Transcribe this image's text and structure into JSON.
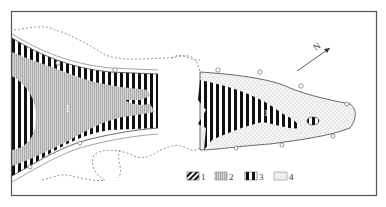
{
  "figure": {
    "north_label": "N",
    "zone_labels": {
      "left": "I",
      "right": "II"
    },
    "legend": [
      {
        "id": "1",
        "label": "1",
        "pattern": "diagonal-hatch"
      },
      {
        "id": "2",
        "label": "2",
        "pattern": "fine-vertical-gray"
      },
      {
        "id": "3",
        "label": "3",
        "pattern": "bold-vertical-stripes"
      },
      {
        "id": "4",
        "label": "4",
        "pattern": "stipple-dots"
      }
    ],
    "colors": {
      "frame": "#555555",
      "stripe": "#111111",
      "gray_fill": "#bdbdbd",
      "stipple_bg": "#f2f2f2",
      "dashed_line": "#777777"
    }
  }
}
